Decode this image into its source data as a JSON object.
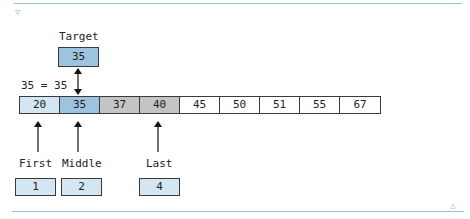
{
  "diagram": {
    "target": {
      "label": "Target",
      "value": "35"
    },
    "comparison": "35 = 35",
    "array": [
      {
        "value": "20",
        "state": "searched"
      },
      {
        "value": "35",
        "state": "found"
      },
      {
        "value": "37",
        "state": "range"
      },
      {
        "value": "40",
        "state": "range"
      },
      {
        "value": "45",
        "state": "excluded"
      },
      {
        "value": "50",
        "state": "excluded"
      },
      {
        "value": "51",
        "state": "excluded"
      },
      {
        "value": "55",
        "state": "excluded"
      },
      {
        "value": "67",
        "state": "excluded"
      }
    ],
    "pointers": [
      {
        "label": "First",
        "index": "1"
      },
      {
        "label": "Middle",
        "index": "2"
      },
      {
        "label": "Last",
        "index": "4"
      }
    ],
    "colors": {
      "searched": "#d4e6f1",
      "found": "#9cc3df",
      "range": "#c4c4c4",
      "excluded": "#ffffff",
      "index_box": "#d4e6f1",
      "rule": "#9cc0d4"
    }
  },
  "controls": {
    "collapse_icon": "▽",
    "expand_icon": "△"
  }
}
